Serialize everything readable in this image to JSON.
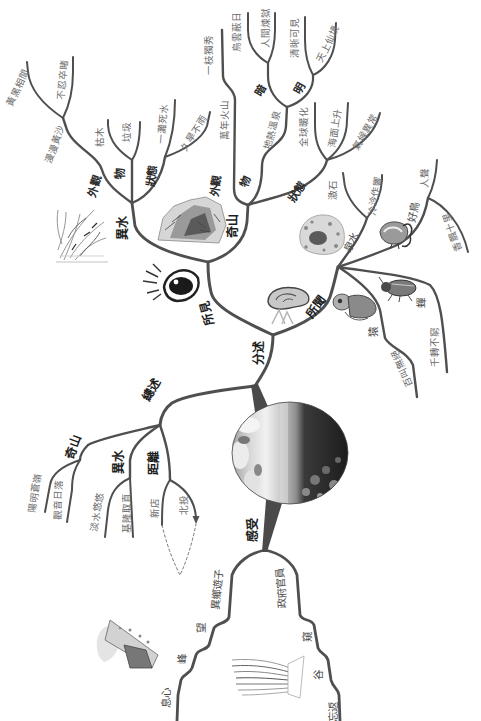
{
  "diagram": {
    "type": "mind-map",
    "central_image": "river-landscape-photo"
  },
  "overview": {
    "label": "總述",
    "mountain": {
      "label": "奇山",
      "items": [
        "陽明蒼嶺",
        "觀音日落"
      ]
    },
    "water": {
      "label": "異水",
      "items": [
        "淡水悠悠",
        "基隆取直"
      ]
    },
    "distance": {
      "label": "距離",
      "items": [
        "新店",
        "北投"
      ]
    }
  },
  "details": {
    "label": "分述",
    "seen": {
      "label": "所見",
      "icon": "eye-icon",
      "water": {
        "label": "異水",
        "image": "reeds-sketch",
        "appearance": {
          "label": "外觀",
          "path": "漫漫黃沙",
          "items": [
            "黃黑相間",
            "不忍卒睹"
          ]
        },
        "objects": {
          "label": "物",
          "items": [
            "枯木",
            "垃圾"
          ]
        },
        "state": {
          "label": "狀態",
          "items": [
            "一灘死水",
            "久旱不雨"
          ]
        }
      },
      "mountain": {
        "label": "奇山",
        "image": "mountain-sketch",
        "appearance": {
          "label": "外觀",
          "items": [
            "萬年火山",
            "一枝獨秀"
          ]
        },
        "objects": {
          "label": "物",
          "path": "地熱溫泉",
          "dark": {
            "label": "暗",
            "items": [
              "烏雲蔽日",
              "人間煉獄"
            ]
          },
          "bright": {
            "label": "明",
            "items": [
              "清晰可見",
              "天上仙境"
            ]
          }
        },
        "state": {
          "label": "狀態",
          "items": [
            "全球暖化",
            "海面上升",
            "氣候異常"
          ]
        }
      }
    },
    "heard": {
      "label": "所聞",
      "icon": "ear-icon",
      "spring": {
        "label": "泉水",
        "image": "stream-rocks-sketch",
        "items": [
          "激石",
          "泠泠作響"
        ]
      },
      "bird": {
        "label": "好鳥",
        "image": "bird-sketch",
        "items": [
          "人聲",
          "香飄十里"
        ]
      },
      "cicada": {
        "label": "蟬",
        "image": "cicada-sketch",
        "items": [
          "千轉不窮"
        ]
      },
      "ape": {
        "label": "猿",
        "image": "monkey-sketch",
        "items": [
          "百叫無絕"
        ]
      }
    }
  },
  "feelings": {
    "label": "感受",
    "wanderer": {
      "label": "異鄉遊子",
      "steps": [
        "望",
        "峰",
        "息心"
      ],
      "image": "mountain-map-sketch"
    },
    "official": {
      "label": "政府官員",
      "steps": [
        "窺",
        "谷",
        "忘返"
      ],
      "image": "valley-sketch"
    }
  },
  "colors": {
    "branch": "#4f4f4f",
    "label": "#1e1e1e",
    "leaf": "#6b6b6b",
    "background": "#ffffff"
  }
}
